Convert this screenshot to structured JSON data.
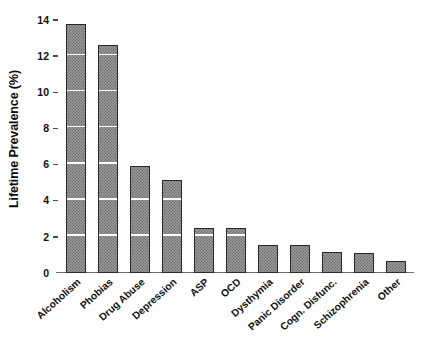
{
  "chart_data": {
    "type": "bar",
    "title": "",
    "subtitle": "",
    "xlabel": "",
    "ylabel": "Lifetime Prevalence (%)",
    "ylim": [
      0,
      14
    ],
    "yticks": [
      0,
      2,
      4,
      6,
      8,
      10,
      12,
      14
    ],
    "ytick_labels": [
      "0",
      "2",
      "4",
      "6",
      "8",
      "10",
      "12",
      "14"
    ],
    "grid": "horizontal-white-overlay-on-bars",
    "legend": "none",
    "bar_fill": "#9a9a9a",
    "bar_pattern_color": "#6e6e6e",
    "bar_edge_color": "#2a2a2a",
    "axis_color": "#6f6f6f",
    "categories": [
      "Alcoholism",
      "Phobias",
      "Drug Abuse",
      "Depression",
      "ASP",
      "OCD",
      "Dysthymia",
      "Panic Disorder",
      "Cogn. Disfunc.",
      "Schizophrenia",
      "Other"
    ],
    "values": [
      13.8,
      12.6,
      5.9,
      5.15,
      2.5,
      2.5,
      1.55,
      1.55,
      1.15,
      1.1,
      0.65
    ]
  }
}
